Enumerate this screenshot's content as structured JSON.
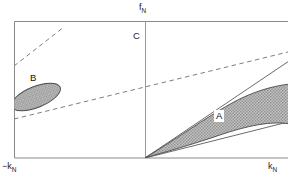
{
  "figure": {
    "type": "phase-diagram",
    "background": "#ffffff",
    "frame": {
      "x": 14,
      "y": 21,
      "width": 274,
      "height": 137,
      "stroke": "#8a8a8a"
    },
    "vertical_axis_x": 145
  },
  "axes": {
    "top_label": {
      "base": "f",
      "sub": "N",
      "x": 139,
      "y": 4
    },
    "left_label": {
      "base": "−k",
      "sub": "N",
      "x": 3,
      "y": 163
    },
    "right_label": {
      "base": "k",
      "sub": "N",
      "x": 268,
      "y": 163
    },
    "curve_label_c": {
      "text": "C",
      "x": 134,
      "y": 32
    }
  },
  "regions": [
    {
      "name": "A",
      "label": "A",
      "label_x": 214,
      "label_y": 110,
      "boxed_label": true,
      "fill": "#b9b9b9",
      "stroke": "#4a4a4a",
      "description": "cusp-shaped instability lobe emanating from origin into the +k_N half plane"
    },
    {
      "name": "B",
      "label": "B",
      "label_x": 30,
      "label_y": 73,
      "boxed_label": false,
      "fill": "#b9b9b9",
      "stroke": "#4a4a4a",
      "description": "tilted elliptical lobe clipped by the left frame edge in the -k_N half plane"
    }
  ],
  "lines": {
    "dashed": [
      {
        "name": "steep-dashed-upper-left",
        "x1": 14,
        "y1": 66,
        "x2": 64,
        "y2": 27
      },
      {
        "name": "shallow-dashed-diagonal",
        "x1": 14,
        "y1": 119,
        "x2": 288,
        "y2": 52
      }
    ],
    "solid": [
      {
        "name": "upper-solid-ray-from-origin",
        "x1": 145,
        "y1": 158,
        "x2": 288,
        "y2": 62
      },
      {
        "name": "lower-solid-ray-from-origin",
        "x1": 145,
        "y1": 158,
        "x2": 288,
        "y2": 122
      }
    ]
  },
  "colors": {
    "frame_stroke": "#8a8a8a",
    "region_fill": "#b9b9b9",
    "region_stroke": "#4a4a4a",
    "line_stroke": "#6b6b6b",
    "text": "#1a1a1a"
  }
}
